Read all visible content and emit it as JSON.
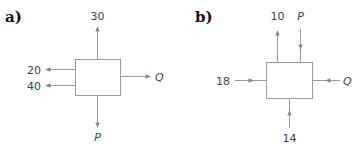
{
  "diagram": {
    "type": "flow-balance-blocks",
    "panels": [
      {
        "label": "a)",
        "flows": [
          {
            "label": "30",
            "side": "top",
            "direction": "out"
          },
          {
            "label": "20",
            "side": "left",
            "direction": "out"
          },
          {
            "label": "40",
            "side": "left",
            "direction": "out"
          },
          {
            "label": "Q",
            "side": "right",
            "direction": "out",
            "unknown": true
          },
          {
            "label": "P",
            "side": "bottom",
            "direction": "out",
            "unknown": true
          }
        ]
      },
      {
        "label": "b)",
        "flows": [
          {
            "label": "10",
            "side": "top",
            "direction": "out"
          },
          {
            "label": "P",
            "side": "top",
            "direction": "in",
            "unknown": true
          },
          {
            "label": "18",
            "side": "left",
            "direction": "in"
          },
          {
            "label": "Q",
            "side": "right",
            "direction": "in",
            "unknown": true
          },
          {
            "label": "14",
            "side": "bottom",
            "direction": "in"
          }
        ]
      }
    ],
    "colors": {
      "line": "#9a9a9a",
      "text": "#444444",
      "heading": "#111111"
    }
  }
}
